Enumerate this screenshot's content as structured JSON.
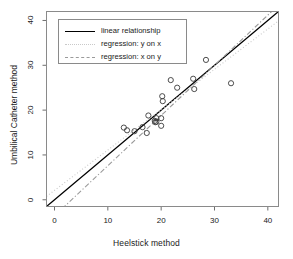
{
  "chart_data": {
    "type": "scatter",
    "title": "",
    "xlabel": "Heelstick method",
    "ylabel": "Umbilical Catheter method",
    "xlim": [
      -1.5,
      42
    ],
    "ylim": [
      -1.5,
      42
    ],
    "xticks": [
      0,
      10,
      20,
      30,
      40
    ],
    "yticks": [
      0,
      10,
      20,
      30,
      40
    ],
    "grid": false,
    "legend_position": "top-left",
    "marker": "open-circle",
    "points": [
      {
        "x": 13.0,
        "y": 16.1
      },
      {
        "x": 13.6,
        "y": 15.5
      },
      {
        "x": 15.0,
        "y": 15.3
      },
      {
        "x": 16.5,
        "y": 16.2
      },
      {
        "x": 17.3,
        "y": 14.9
      },
      {
        "x": 17.6,
        "y": 18.8
      },
      {
        "x": 18.8,
        "y": 17.6
      },
      {
        "x": 18.9,
        "y": 17.3
      },
      {
        "x": 19.1,
        "y": 18.2
      },
      {
        "x": 19.1,
        "y": 17.4
      },
      {
        "x": 20.0,
        "y": 18.2
      },
      {
        "x": 20.0,
        "y": 16.5
      },
      {
        "x": 20.2,
        "y": 23.1
      },
      {
        "x": 20.3,
        "y": 22.0
      },
      {
        "x": 21.8,
        "y": 26.7
      },
      {
        "x": 23.0,
        "y": 25.0
      },
      {
        "x": 26.0,
        "y": 27.0
      },
      {
        "x": 26.2,
        "y": 24.7
      },
      {
        "x": 28.4,
        "y": 31.2
      },
      {
        "x": 33.1,
        "y": 26.0
      }
    ],
    "lines": [
      {
        "name": "linear relationship",
        "style": "solid",
        "color": "#000000",
        "slope": 1.0,
        "intercept": 0.0
      },
      {
        "name": "regression: y on x",
        "style": "dotted",
        "color": "#c9c9c9",
        "slope": 0.9,
        "intercept": 2.1
      },
      {
        "name": "regression: x on y",
        "style": "dashdot",
        "color": "#9a9a9a",
        "slope": 1.12,
        "intercept": -3.6
      }
    ]
  },
  "legend": {
    "items": [
      {
        "label": "linear relationship"
      },
      {
        "label": "regression: y on x"
      },
      {
        "label": "regression: x on y"
      }
    ]
  },
  "axis": {
    "x_tick_labels": [
      "0",
      "10",
      "20",
      "30",
      "40"
    ],
    "y_tick_labels": [
      "0",
      "10",
      "20",
      "30",
      "40"
    ],
    "x_title": "Heelstick method",
    "y_title": "Umbilical Catheter method"
  }
}
